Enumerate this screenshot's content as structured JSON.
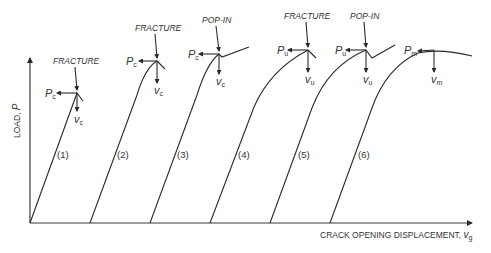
{
  "figure": {
    "y_axis_label": "LOAD, ",
    "y_axis_symbol": "P",
    "x_axis_label": "CRACK OPENING DISPLACEMENT, ",
    "x_axis_symbol": "v",
    "x_axis_symbol_sub": "g"
  },
  "curves": [
    {
      "id": "(1)",
      "event": "FRACTURE",
      "load_symbol": "P",
      "load_sub": "c",
      "disp_symbol": "v",
      "disp_sub": "c"
    },
    {
      "id": "(2)",
      "event": "FRACTURE",
      "load_symbol": "P",
      "load_sub": "c",
      "disp_symbol": "v",
      "disp_sub": "c"
    },
    {
      "id": "(3)",
      "event": "POP-IN",
      "load_symbol": "P",
      "load_sub": "c",
      "disp_symbol": "v",
      "disp_sub": "c"
    },
    {
      "id": "(4)",
      "event": "",
      "load_symbol": "P",
      "load_sub": "u",
      "disp_symbol": "v",
      "disp_sub": "u"
    },
    {
      "id": "(5)",
      "event": "FRACTURE",
      "load_symbol": "P",
      "load_sub": "u",
      "disp_symbol": "v",
      "disp_sub": "u"
    },
    {
      "id": "(6)",
      "event": "POP-IN",
      "load_symbol": "P",
      "load_sub": "u",
      "disp_symbol": "v",
      "disp_sub": "u"
    },
    {
      "id": "(7)",
      "event": "",
      "load_symbol": "P",
      "load_sub": "m",
      "disp_symbol": "v",
      "disp_sub": "m"
    }
  ],
  "labels": {
    "c1": "(1)",
    "c2": "(2)",
    "c3": "(3)",
    "c4": "(4)",
    "c5": "(5)",
    "c6": "(6)",
    "fracture": "FRACTURE",
    "popin": "POP-IN",
    "P": "P",
    "v": "v",
    "sub_c": "c",
    "sub_u": "u",
    "sub_m": "m"
  }
}
